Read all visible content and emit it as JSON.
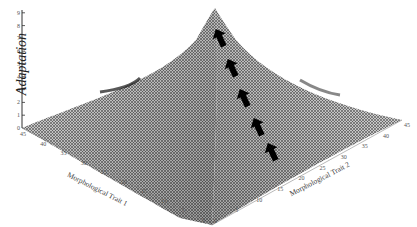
{
  "chart_data": {
    "type": "surface3d",
    "title": "",
    "zlabel": "Adaptation",
    "xlabel": "Morphological Trait 1",
    "ylabel": "Morphological Trait 2",
    "z_ticks": [
      "0",
      "1",
      "2",
      "3",
      "4",
      "5",
      "6",
      "7",
      "8",
      "9"
    ],
    "zlim": [
      0,
      9
    ],
    "x_ticks": [
      "45",
      "40",
      "35",
      "30",
      "25",
      "20",
      "15",
      "10",
      "5",
      "0"
    ],
    "y_ticks": [
      "0",
      "5",
      "10",
      "15",
      "20",
      "25",
      "30",
      "35",
      "40",
      "45"
    ],
    "xlim": [
      0,
      45
    ],
    "ylim": [
      0,
      45
    ],
    "surface": "single central peak (adaptive peak) rising to ~9 at center, falling to ~0 at corners, with shallow ridges along diagonals",
    "peak": {
      "x": 22.5,
      "y": 22.5,
      "z": 9
    },
    "annotations": [
      {
        "type": "arrow",
        "count": 5,
        "direction": "uphill toward peak",
        "color": "#000000"
      }
    ],
    "grid": "wireframe mesh"
  }
}
